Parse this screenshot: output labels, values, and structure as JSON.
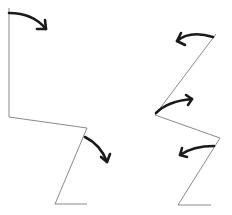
{
  "diagram": {
    "width": 232,
    "height": 215,
    "colors": {
      "line": "#8a8a8a",
      "arrow": "#1a1a1a",
      "background": "#ffffff"
    },
    "figures": [
      {
        "name": "left-figure",
        "polyline": "9,8 9,117 87,128 55,204 87,204",
        "arrows": [
          {
            "name": "arrow-top-clockwise",
            "path": "M9,13 Q33,13 46,29",
            "head": "M37,29 L46,29 L45,20"
          },
          {
            "name": "arrow-knee-clockwise",
            "path": "M85,137 Q101,145 107,162",
            "head": "M101,157 L107,162 L110,154"
          }
        ]
      },
      {
        "name": "right-figure",
        "polyline": "216,34 155,115 220,138 178,205 211,205",
        "arrows": [
          {
            "name": "arrow-top-counterclockwise",
            "path": "M213,37 Q190,30 177,41",
            "head": "M181,33 L177,41 L185,45"
          },
          {
            "name": "arrow-hip-counterclockwise",
            "path": "M156,113 Q168,101 192,99",
            "head": "M186,95 L192,99 L188,105"
          },
          {
            "name": "arrow-knee-counterclockwise",
            "path": "M214,146 Q193,146 180,155",
            "head": "M182,148 L180,155 L187,157"
          }
        ]
      }
    ]
  }
}
